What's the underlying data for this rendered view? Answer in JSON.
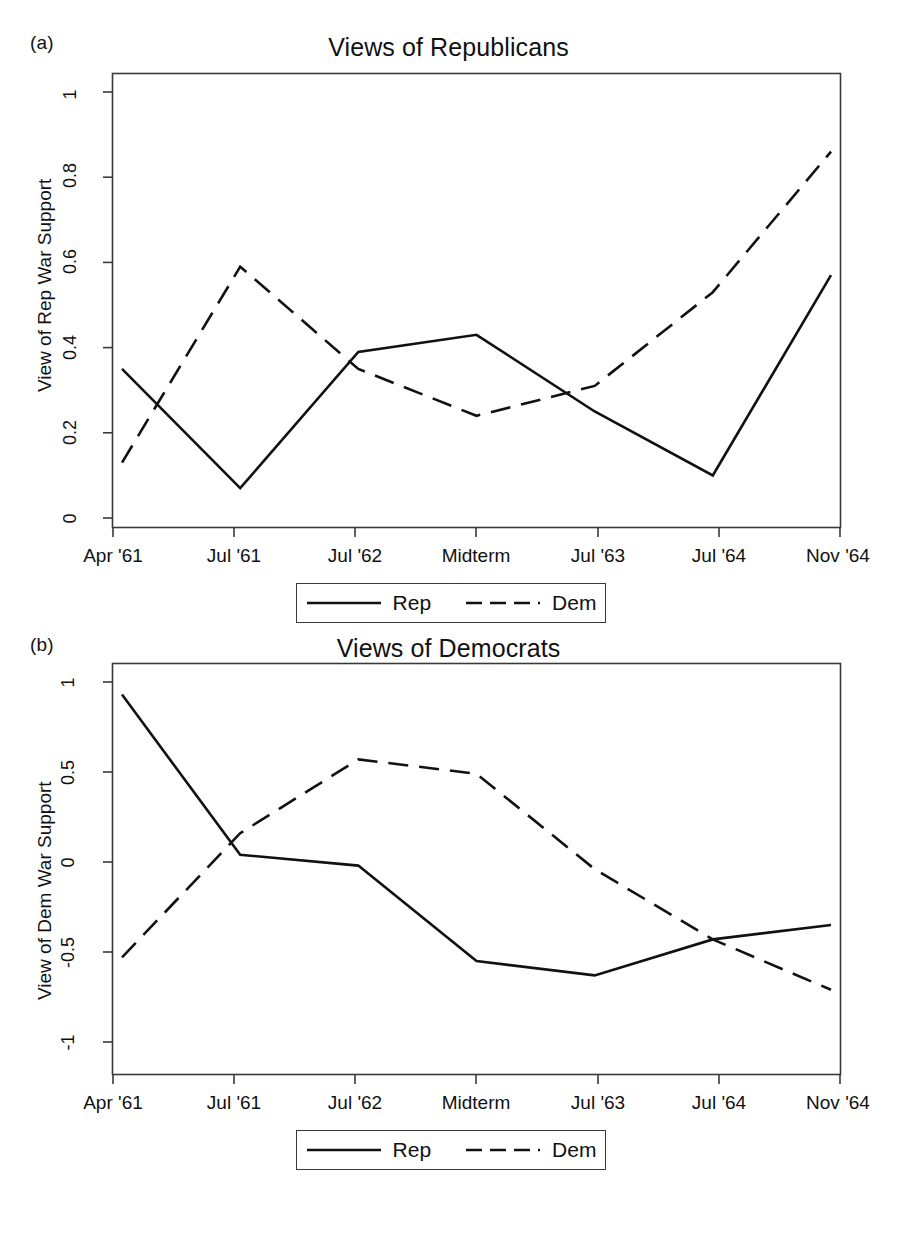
{
  "figure": {
    "panels": [
      {
        "tag": "(a)",
        "title": "Views of Republicans",
        "ylabel": "View of Rep War Support",
        "yticks": [
          "0",
          "0.2",
          "0.4",
          "0.6",
          "0.8",
          "1"
        ]
      },
      {
        "tag": "(b)",
        "title": "Views of Democrats",
        "ylabel": "View of Dem War Support",
        "yticks": [
          "-1",
          "-0.5",
          "0",
          "0.5",
          "1"
        ]
      }
    ],
    "legend": {
      "entries": [
        {
          "label": "Rep",
          "style": "solid"
        },
        {
          "label": "Dem",
          "style": "dashed"
        }
      ]
    },
    "colors": {
      "line": "#111111",
      "axis": "#3a3a3a",
      "background": "#ffffff"
    }
  },
  "chart_data": [
    {
      "type": "line",
      "title": "Views of Republicans",
      "panel_tag": "(a)",
      "xlabel": "",
      "ylabel": "View of Rep War Support",
      "categories": [
        "Apr '61",
        "Jul '61",
        "Jul '62",
        "Midterm",
        "Jul '63",
        "Jul '64",
        "Nov '64"
      ],
      "ylim": [
        0,
        1
      ],
      "yticks": [
        0,
        0.2,
        0.4,
        0.6,
        0.8,
        1
      ],
      "grid": false,
      "legend_position": "below-axis",
      "series": [
        {
          "name": "Rep",
          "style": "solid",
          "values": [
            0.35,
            0.07,
            0.39,
            0.43,
            0.25,
            0.1,
            0.57
          ]
        },
        {
          "name": "Dem",
          "style": "dashed",
          "values": [
            0.13,
            0.59,
            0.35,
            0.24,
            0.31,
            0.53,
            0.86
          ]
        }
      ]
    },
    {
      "type": "line",
      "title": "Views of Democrats",
      "panel_tag": "(b)",
      "xlabel": "",
      "ylabel": "View of Dem War Support",
      "categories": [
        "Apr '61",
        "Jul '61",
        "Jul '62",
        "Midterm",
        "Jul '63",
        "Jul '64",
        "Nov '64"
      ],
      "ylim": [
        -1,
        1
      ],
      "yticks": [
        -1,
        -0.5,
        0,
        0.5,
        1
      ],
      "grid": false,
      "legend_position": "below-axis",
      "series": [
        {
          "name": "Rep",
          "style": "solid",
          "values": [
            0.93,
            0.04,
            -0.02,
            -0.55,
            -0.63,
            -0.43,
            -0.35
          ]
        },
        {
          "name": "Dem",
          "style": "dashed",
          "values": [
            -0.53,
            0.16,
            0.57,
            0.49,
            -0.04,
            -0.43,
            -0.71
          ]
        }
      ]
    }
  ]
}
